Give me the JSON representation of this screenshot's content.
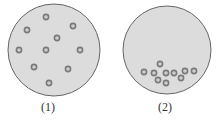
{
  "panels": [
    {
      "label": "(1)",
      "circle": {
        "cx": 54,
        "cy": 50,
        "r": 46
      },
      "particles": [
        [
          46,
          17
        ],
        [
          73,
          26
        ],
        [
          27,
          30
        ],
        [
          57,
          38
        ],
        [
          19,
          50
        ],
        [
          46,
          50
        ],
        [
          80,
          50
        ],
        [
          34,
          67
        ],
        [
          68,
          69
        ],
        [
          49,
          83
        ]
      ],
      "label_pos": {
        "x": 48,
        "y": 100
      }
    },
    {
      "label": "(2)",
      "circle": {
        "cx": 167,
        "cy": 50,
        "r": 44
      },
      "particles": [
        [
          160,
          64
        ],
        [
          144,
          72
        ],
        [
          154,
          73
        ],
        [
          166,
          73
        ],
        [
          174,
          73
        ],
        [
          185,
          71
        ],
        [
          194,
          71
        ],
        [
          158,
          80
        ],
        [
          166,
          83
        ],
        [
          181,
          78
        ]
      ],
      "label_pos": {
        "x": 165,
        "y": 100
      }
    }
  ],
  "colors": {
    "fill": "#dcdcdc",
    "stroke": "#666666",
    "particle_ring": "#7a7a7a",
    "particle_center": "#cfcfcf"
  }
}
